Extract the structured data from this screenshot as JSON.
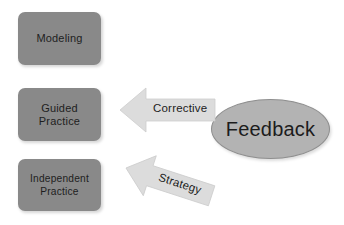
{
  "diagram": {
    "background_color": "#ffffff",
    "stage_box_color": "#898989",
    "feedback_node_color": "#b3b3b3",
    "arrow_color": "#dcdcdc",
    "text_color": "#1c1c1c",
    "stages": [
      {
        "id": "modeling",
        "label": "Modeling"
      },
      {
        "id": "guided",
        "label": "Guided\nPractice"
      },
      {
        "id": "independent",
        "label": "Independent\nPractice"
      }
    ],
    "source": {
      "id": "feedback",
      "label": "Feedback",
      "shape": "ellipse"
    },
    "arrows": [
      {
        "id": "corrective",
        "label": "Corrective",
        "from": "feedback",
        "to": "guided",
        "direction": "left"
      },
      {
        "id": "strategy",
        "label": "Strategy",
        "from": "feedback",
        "to": "independent",
        "direction": "down-left"
      }
    ]
  }
}
